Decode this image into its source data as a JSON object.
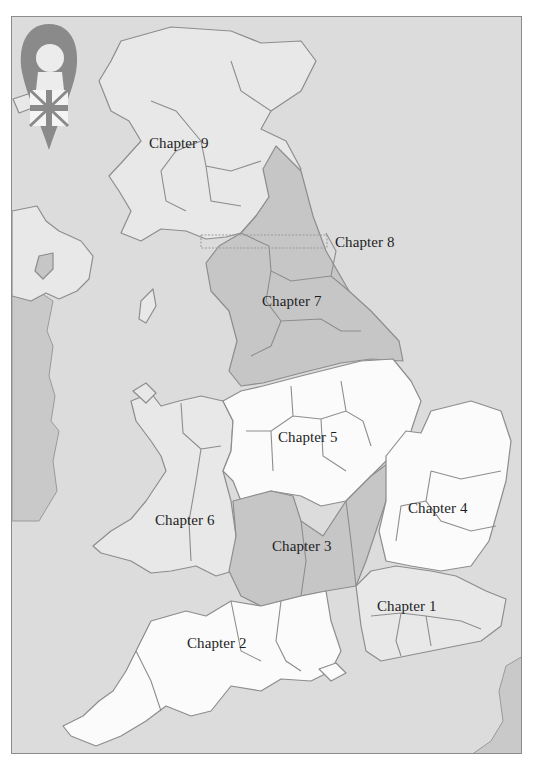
{
  "map": {
    "title": "Map of Great Britain by chapter",
    "colors": {
      "sea": "#dcdcdc",
      "land": "#e8e8e8",
      "highlight_white": "#fbfbfb",
      "highlight_gray": "#c6c6c6",
      "border": "#8d8d8d",
      "text": "#1e1e1e"
    },
    "emblem": {
      "icon": "britannia-head-union-jack-pin-icon"
    },
    "chapters": [
      {
        "id": 1,
        "label": "Chapter 1",
        "region": "South East / London"
      },
      {
        "id": 2,
        "label": "Chapter 2",
        "region": "South West"
      },
      {
        "id": 3,
        "label": "Chapter 3",
        "region": "Cotswolds / Thames"
      },
      {
        "id": 4,
        "label": "Chapter 4",
        "region": "East Anglia"
      },
      {
        "id": 5,
        "label": "Chapter 5",
        "region": "Midlands"
      },
      {
        "id": 6,
        "label": "Chapter 6",
        "region": "Wales"
      },
      {
        "id": 7,
        "label": "Chapter 7",
        "region": "Northern England"
      },
      {
        "id": 8,
        "label": "Chapter 8",
        "region": "Hadrian's Wall"
      },
      {
        "id": 9,
        "label": "Chapter 9",
        "region": "Scotland"
      }
    ]
  }
}
